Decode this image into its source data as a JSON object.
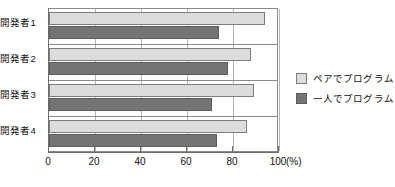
{
  "chart_data": {
    "type": "bar",
    "orientation": "horizontal",
    "title": "",
    "xlabel": "(%)",
    "ylabel": "",
    "xlim": [
      0,
      100
    ],
    "xticks": [
      0,
      20,
      40,
      60,
      80,
      100
    ],
    "xtick_labels": [
      "0",
      "20",
      "40",
      "60",
      "80",
      "100"
    ],
    "unit_label": "(%)",
    "grid": true,
    "legend_position": "right",
    "categories": [
      "開発者1",
      "開発者2",
      "開発者3",
      "開発者4"
    ],
    "series": [
      {
        "name": "ペアでプログラム",
        "color": "#dcdcdc",
        "values": [
          94,
          88,
          89,
          86
        ]
      },
      {
        "name": "一人でプログラム",
        "color": "#747474",
        "values": [
          74,
          78,
          71,
          73
        ]
      }
    ]
  },
  "legend": {
    "items": [
      {
        "label": "ペアでプログラム",
        "swatch": "pair"
      },
      {
        "label": "一人でプログラム",
        "swatch": "solo"
      }
    ]
  },
  "colors": {
    "pair_fill": "#dcdcdc",
    "solo_fill": "#747474",
    "axis": "#6d6d6d",
    "grid": "#b4b4b4",
    "text": "#111111"
  }
}
